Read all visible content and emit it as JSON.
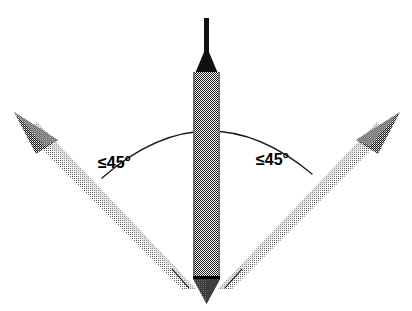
{
  "figure": {
    "background_color": "#ffffff"
  },
  "labels": {
    "left_angle": "≤45°",
    "right_angle": "≤45°"
  },
  "colors": {
    "ink": "#000000",
    "probe_shaft": "#808080",
    "probe_shaft_edge": "#6e6e6e",
    "probe_tip_dark": "#4a4a4a",
    "needle_black": "#111111",
    "arrow_shaft": "#bdbdbd",
    "arrow_head": "#8c8c8c",
    "arc_stroke": "#1a1a1a"
  },
  "geometry": {
    "canvas_width": 412,
    "canvas_height": 311,
    "probe_center_x": 207,
    "probe_top_y": 18,
    "probe_bottom_y": 300,
    "arc_apex_y": 109,
    "max_angle_degrees": 45
  },
  "elements": {
    "probe_needle": "probe-needle",
    "probe_collar": "probe-collar",
    "probe_body": "probe-body",
    "probe_baseline": "probe-baseline",
    "probe_tip": "probe-tip",
    "arrow_left": "arrow-left",
    "arrow_right": "arrow-right",
    "angle_arc": "angle-arc",
    "tick_left": "tick-left",
    "tick_right": "tick-right"
  }
}
